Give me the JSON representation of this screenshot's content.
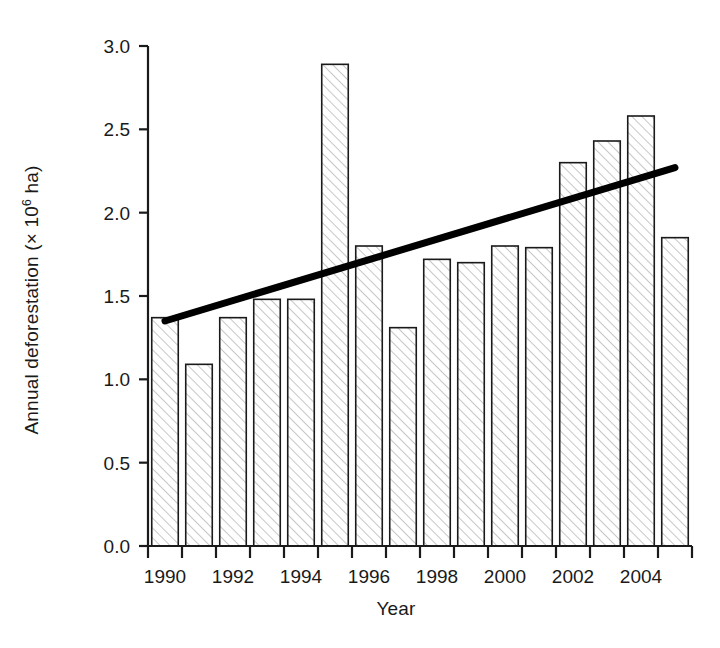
{
  "chart_data": {
    "type": "bar",
    "title": "",
    "subtitle": "",
    "xlabel": "Year",
    "ylabel": "Annual deforestation (× 10⁶ ha)",
    "ylabel_parts": {
      "main": "Annual deforestation (× 10",
      "exponent": "6",
      "tail": " ha)"
    },
    "categories": [
      1990,
      1991,
      1992,
      1993,
      1994,
      1995,
      1996,
      1997,
      1998,
      1999,
      2000,
      2001,
      2002,
      2003,
      2004,
      2005
    ],
    "values": [
      1.37,
      1.09,
      1.37,
      1.48,
      1.48,
      2.89,
      1.8,
      1.31,
      1.72,
      1.7,
      1.8,
      1.79,
      2.3,
      2.43,
      2.58,
      1.85
    ],
    "series": [
      {
        "name": "Annual deforestation",
        "type": "bar",
        "values": [
          1.37,
          1.09,
          1.37,
          1.48,
          1.48,
          2.89,
          1.8,
          1.31,
          1.72,
          1.7,
          1.8,
          1.79,
          2.3,
          2.43,
          2.58,
          1.85
        ]
      },
      {
        "name": "Linear trend",
        "type": "line",
        "x": [
          1990,
          2005
        ],
        "y": [
          1.35,
          2.27
        ]
      }
    ],
    "ylim": [
      0.0,
      3.0
    ],
    "ytick_labels": [
      "0.0",
      "0.5",
      "1.0",
      "1.5",
      "2.0",
      "2.5",
      "3.0"
    ],
    "ytick_values": [
      0.0,
      0.5,
      1.0,
      1.5,
      2.0,
      2.5,
      3.0
    ],
    "xlim": [
      1990,
      2006
    ],
    "xtick_values": [
      1990,
      1991,
      1992,
      1993,
      1994,
      1995,
      1996,
      1997,
      1998,
      1999,
      2000,
      2001,
      2002,
      2003,
      2004,
      2005,
      2006
    ],
    "xtick_labels_shown": [
      "1990",
      "1992",
      "1994",
      "1996",
      "1998",
      "2000",
      "2002",
      "2004"
    ],
    "xtick_labeled_values": [
      1990,
      1992,
      1994,
      1996,
      1998,
      2000,
      2002,
      2004
    ],
    "grid": false,
    "legend": false,
    "legend_position": "none",
    "colors": {
      "bar_fill": "#ffffff",
      "bar_hatch": "#b9b9b9",
      "bar_edge": "#1a1a1a",
      "trend_line": "#000000",
      "axis": "#1a1a1a",
      "background": "#ffffff",
      "text": "#1a1a1a"
    },
    "annotations": []
  }
}
